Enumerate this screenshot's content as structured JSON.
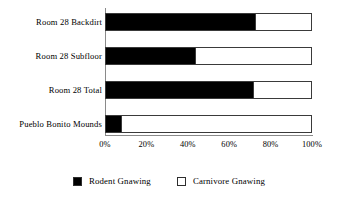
{
  "chart_data": {
    "type": "bar",
    "orientation": "horizontal",
    "stacked": true,
    "stack_total": 100,
    "title": "",
    "subtitle": "",
    "xlabel": "",
    "ylabel": "",
    "xlim": [
      0,
      100
    ],
    "xticks": [
      0,
      20,
      40,
      60,
      80,
      100
    ],
    "xtick_labels": [
      "0%",
      "20%",
      "40%",
      "60%",
      "80%",
      "100%"
    ],
    "grid": false,
    "legend_position": "bottom",
    "categories": [
      "Room 28 Backdirt",
      "Room 28 Subfloor",
      "Room 28 Total",
      "Pueblo Bonito Mounds"
    ],
    "series": [
      {
        "name": "Rodent Gnawing",
        "color": "#000000",
        "values": [
          73,
          44,
          72,
          8
        ]
      },
      {
        "name": "Carnivore Gnawing",
        "color": "#ffffff",
        "values": [
          27,
          56,
          28,
          92
        ]
      }
    ],
    "legend": [
      {
        "label": "Rodent Gnawing",
        "swatch": "filled"
      },
      {
        "label": "Carnivore Gnawing",
        "swatch": "hollow"
      }
    ]
  },
  "colors": {
    "rodent": "#000000",
    "carnivore": "#ffffff",
    "axis": "#8a8a8a",
    "bar_outline": "#3a3a3a",
    "background": "#ffffff",
    "text": "#000000"
  }
}
